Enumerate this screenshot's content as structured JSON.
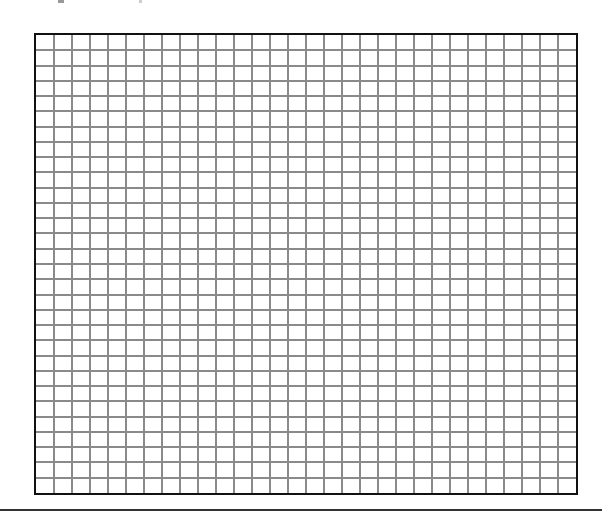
{
  "page": {
    "width": 602,
    "height": 515,
    "background": "#ffffff"
  },
  "grid": {
    "columns": 30,
    "rows": 30,
    "frame": {
      "left": 34,
      "top": 33,
      "width": 544,
      "height": 462
    },
    "border_color": "#111111",
    "line_color": "#8a8a8a",
    "border_width": 2,
    "line_width": 2
  },
  "bottom_rule": {
    "top": 509,
    "color": "#333333"
  },
  "top_fragments": [
    {
      "id": "frag-1",
      "description": "cut-off glyph fragment"
    },
    {
      "id": "frag-2",
      "description": "cut-off glyph fragment"
    }
  ]
}
